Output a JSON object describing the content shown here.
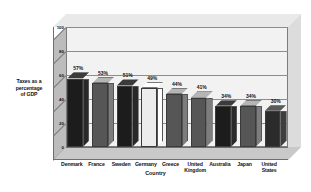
{
  "chart_data": {
    "type": "bar",
    "title": "",
    "xlabel": "Country",
    "ylabel": "Taxes as a percentage of GDP",
    "ylabel_lines": [
      "Taxes as a",
      "percentage",
      "of GDP"
    ],
    "categories": [
      "Denmark",
      "France",
      "Sweden",
      "Germany",
      "Greece",
      "United Kingdom",
      "Australia",
      "Japan",
      "United States"
    ],
    "category_lines": [
      [
        "Denmark"
      ],
      [
        "France"
      ],
      [
        "Sweden"
      ],
      [
        "Germany"
      ],
      [
        "Greece"
      ],
      [
        "United",
        "Kingdom"
      ],
      [
        "Australia"
      ],
      [
        "Japan"
      ],
      [
        "United",
        "States"
      ]
    ],
    "values": [
      57,
      53,
      51,
      49,
      44,
      41,
      34,
      34,
      30
    ],
    "data_labels": [
      "57%",
      "53%",
      "51%",
      "49%",
      "44%",
      "41%",
      "34%",
      "34%",
      "30%"
    ],
    "bar_colors": [
      "#1c1c1c",
      "#565656",
      "#1c1c1c",
      "#ececec",
      "#565656",
      "#565656",
      "#1c1c1c",
      "#565656",
      "#2b2b2b"
    ],
    "ylim": [
      0,
      100
    ],
    "yticks": [
      0,
      20,
      40,
      60,
      80,
      100
    ],
    "ytick_labels": [
      "0",
      "20",
      "40",
      "60",
      "80",
      "100"
    ],
    "grid": true,
    "legend": "none",
    "style": "3d-column",
    "palette": {
      "back_wall": "#f2f2f2",
      "left_wall": "#bcbcbc",
      "floor": "#c9c9c9",
      "top_face": "#e9e9e9",
      "gridline": "#8c8c8c",
      "outline": "#6e6e6e",
      "text": "#111111",
      "background": "#ffffff"
    }
  }
}
